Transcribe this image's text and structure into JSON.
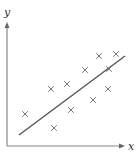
{
  "chart_data": {
    "type": "scatter",
    "title": "",
    "xlabel": "x",
    "ylabel": "y",
    "grid": false,
    "legend": null,
    "x_ticks": [],
    "y_ticks": [],
    "points": [
      {
        "x": 25,
        "y": 114
      },
      {
        "x": 51,
        "y": 89
      },
      {
        "x": 54,
        "y": 128
      },
      {
        "x": 67,
        "y": 84
      },
      {
        "x": 71,
        "y": 110
      },
      {
        "x": 85,
        "y": 70
      },
      {
        "x": 93,
        "y": 100
      },
      {
        "x": 99,
        "y": 56
      },
      {
        "x": 108,
        "y": 89
      },
      {
        "x": 109,
        "y": 69
      },
      {
        "x": 116,
        "y": 54
      }
    ],
    "trend_line": {
      "x1": 19,
      "y1": 135,
      "x2": 125,
      "y2": 56
    },
    "annotations": [
      "line of best fit"
    ]
  },
  "axes": {
    "x_label": "x",
    "y_label": "y"
  },
  "colors": {
    "axis": "#888888",
    "marker": "#777777",
    "line": "#555555",
    "text": "#333333"
  }
}
